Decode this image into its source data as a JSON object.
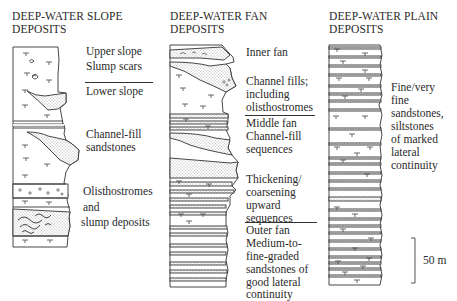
{
  "columns": [
    {
      "title_line1": "DEEP-WATER SLOPE",
      "title_line2": "DEPOSITS",
      "labels": [
        {
          "text": "Upper slope"
        },
        {
          "text": "Slump scars"
        },
        {
          "text": "Lower slope"
        },
        {
          "text": "Channel-fill"
        },
        {
          "text": "sandstones"
        },
        {
          "text": "Olisthostromes"
        },
        {
          "text": "and"
        },
        {
          "text": "slump deposits"
        }
      ]
    },
    {
      "title_line1": "DEEP-WATER FAN",
      "title_line2": "DEPOSITS",
      "labels": [
        {
          "text": "Inner fan"
        },
        {
          "text": "Channel fills;"
        },
        {
          "text": "including"
        },
        {
          "text": "olisthostromes"
        },
        {
          "text": "Middle fan"
        },
        {
          "text": "Channel-fill"
        },
        {
          "text": "sequences"
        },
        {
          "text": "Thickening/"
        },
        {
          "text": "coarsening"
        },
        {
          "text": "upward"
        },
        {
          "text": "sequences"
        },
        {
          "text": "Outer fan"
        },
        {
          "text": "Medium-to-"
        },
        {
          "text": "fine-graded"
        },
        {
          "text": "sandstones of"
        },
        {
          "text": "good lateral"
        },
        {
          "text": "continuity"
        }
      ]
    },
    {
      "title_line1": "DEEP-WATER PLAIN",
      "title_line2": "DEPOSITS",
      "labels": [
        {
          "text": "Fine/very"
        },
        {
          "text": "fine"
        },
        {
          "text": "sandstones,"
        },
        {
          "text": "siltstones"
        },
        {
          "text": "of marked"
        },
        {
          "text": "lateral"
        },
        {
          "text": "continuity"
        }
      ]
    }
  ],
  "scale_bar": {
    "label": "50 m"
  }
}
